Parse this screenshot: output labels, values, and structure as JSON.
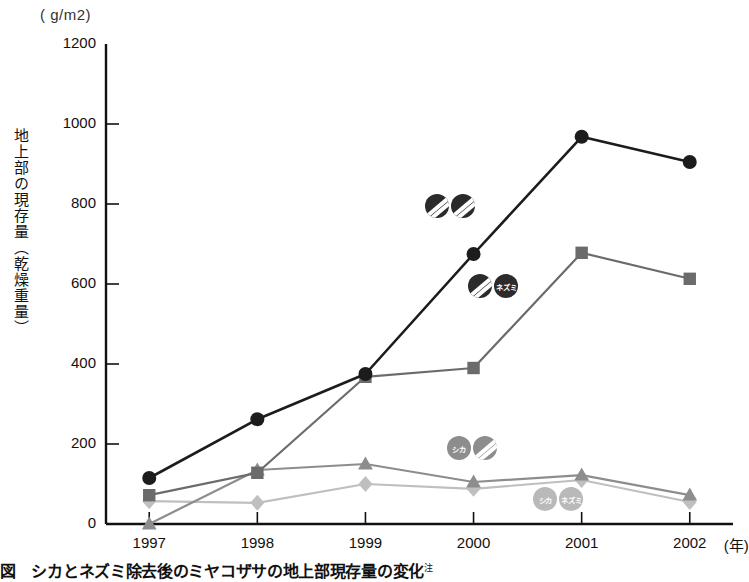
{
  "chart_data": {
    "type": "line",
    "title": "",
    "xlabel": "年",
    "ylabel": "地上部の現存量（乾燥重量）",
    "unit_label": "( g/m2)",
    "categories": [
      "1997",
      "1998",
      "1999",
      "2000",
      "2001",
      "2002"
    ],
    "x": [
      1997,
      1998,
      1999,
      2000,
      2001,
      2002
    ],
    "ylim": [
      0,
      1200
    ],
    "xlim": [
      1996.6,
      2002.4
    ],
    "yticks": [
      0,
      200,
      400,
      600,
      800,
      1000,
      1200
    ],
    "grid": false,
    "legend_position": "none",
    "series": [
      {
        "name": "シカ・ネズミ除去区",
        "marker": "circle",
        "color": "#1c1c1c",
        "values": [
          115,
          262,
          375,
          675,
          968,
          905
        ]
      },
      {
        "name": "シカ除去区",
        "marker": "square",
        "color": "#6b6b6b",
        "values": [
          72,
          128,
          368,
          390,
          678,
          613
        ]
      },
      {
        "name": "ネズミ除去区",
        "marker": "triangle",
        "color": "#8d8d8d",
        "values": [
          0,
          135,
          150,
          105,
          122,
          72
        ]
      },
      {
        "name": "対照区",
        "marker": "diamond",
        "color": "#bfbfbf",
        "values": [
          57,
          53,
          100,
          88,
          110,
          55
        ]
      }
    ],
    "annotations": [
      {
        "id": "ann-top",
        "x_value": 1999.55,
        "y_value": 795,
        "badges": [
          {
            "label": "",
            "tone": "dark",
            "icon": "hatched-circle-icon"
          },
          {
            "label": "",
            "tone": "dark",
            "icon": "hatched-circle-icon"
          }
        ]
      },
      {
        "id": "ann-mid",
        "x_value": 1999.95,
        "y_value": 595,
        "badges": [
          {
            "label": "",
            "tone": "dark",
            "icon": "hatched-circle-icon"
          },
          {
            "label": "ネズミ",
            "tone": "dark",
            "icon": "nezumi-badge-icon"
          }
        ]
      },
      {
        "id": "ann-low",
        "x_value": 1999.75,
        "y_value": 190,
        "badges": [
          {
            "label": "シカ",
            "tone": "mid",
            "icon": "shika-badge-icon"
          },
          {
            "label": "",
            "tone": "mid",
            "icon": "hatched-circle-icon"
          }
        ]
      },
      {
        "id": "ann-bottom",
        "x_value": 2000.55,
        "y_value": 62,
        "badges": [
          {
            "label": "シカ",
            "tone": "light",
            "icon": "shika-badge-icon"
          },
          {
            "label": "ネズミ",
            "tone": "light",
            "icon": "nezumi-badge-icon"
          }
        ]
      }
    ]
  },
  "caption": {
    "text": "図　シカとネズミ除去後のミヤコザサの地上部現存量の変化",
    "superscript": "注"
  }
}
